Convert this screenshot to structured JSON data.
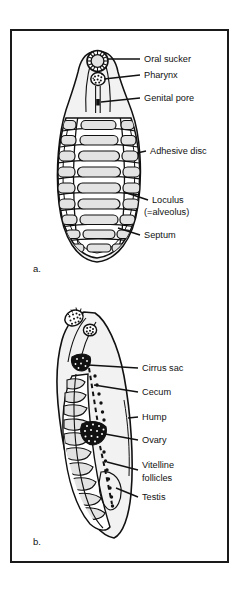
{
  "figure": {
    "background_color": "#ffffff",
    "frame_color": "#1a1a1a",
    "ink_color": "#111111",
    "organ_fill_color": "#e3e3e3",
    "body_fill_color": "#f2f2f2",
    "dark_fill_color": "#1a1a1a",
    "caption_a": "a.",
    "caption_b": "b."
  },
  "panel_a": {
    "letter": "a.",
    "description": "Ventral view of aspidogastrean trematode showing adhesive disc with loculi",
    "labels": [
      {
        "id": "oral-sucker",
        "text": "Oral sucker"
      },
      {
        "id": "pharynx",
        "text": "Pharynx"
      },
      {
        "id": "genital-pore",
        "text": "Genital pore"
      },
      {
        "id": "adhesive-disc",
        "text": "Adhesive disc"
      },
      {
        "id": "loculus",
        "text": "Loculus"
      },
      {
        "id": "loculus-alt",
        "text": "(=alveolus)"
      },
      {
        "id": "septum",
        "text": "Septum"
      }
    ]
  },
  "panel_b": {
    "letter": "b.",
    "description": "Lateral view of aspidogastrean trematode showing internal organs",
    "labels": [
      {
        "id": "cirrus-sac",
        "text": "Cirrus sac"
      },
      {
        "id": "cecum",
        "text": "Cecum"
      },
      {
        "id": "hump",
        "text": "Hump"
      },
      {
        "id": "ovary",
        "text": "Ovary"
      },
      {
        "id": "vitelline-line1",
        "text": "Vitelline"
      },
      {
        "id": "vitelline-line2",
        "text": "follicles"
      },
      {
        "id": "testis",
        "text": "Testis"
      }
    ]
  }
}
